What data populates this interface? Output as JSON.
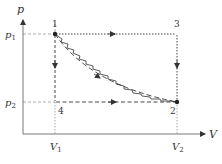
{
  "diagram": {
    "type": "pv-diagram",
    "axes": {
      "y_label": "p",
      "x_label": "V"
    },
    "ticks": {
      "p1": "p",
      "p1_sub": "1",
      "p2": "p",
      "p2_sub": "2",
      "v1": "V",
      "v1_sub": "1",
      "v2": "V",
      "v2_sub": "2"
    },
    "points": [
      {
        "id": "1",
        "label": "1"
      },
      {
        "id": "2",
        "label": "2"
      },
      {
        "id": "3",
        "label": "3"
      },
      {
        "id": "4",
        "label": "4"
      }
    ],
    "paths": [
      {
        "name": "1-3",
        "style": "dotted",
        "direction": "right"
      },
      {
        "name": "3-2",
        "style": "dotted",
        "direction": "down"
      },
      {
        "name": "1-4",
        "style": "dashed",
        "direction": "down"
      },
      {
        "name": "4-2",
        "style": "dashed",
        "direction": "right"
      },
      {
        "name": "1-2 curve",
        "style": "long-dash",
        "direction": "down-right"
      },
      {
        "name": "1-2 zigzag",
        "style": "zigzag",
        "direction": "down-right"
      }
    ],
    "colors": {
      "line": "#333333",
      "guide": "#888888"
    }
  }
}
